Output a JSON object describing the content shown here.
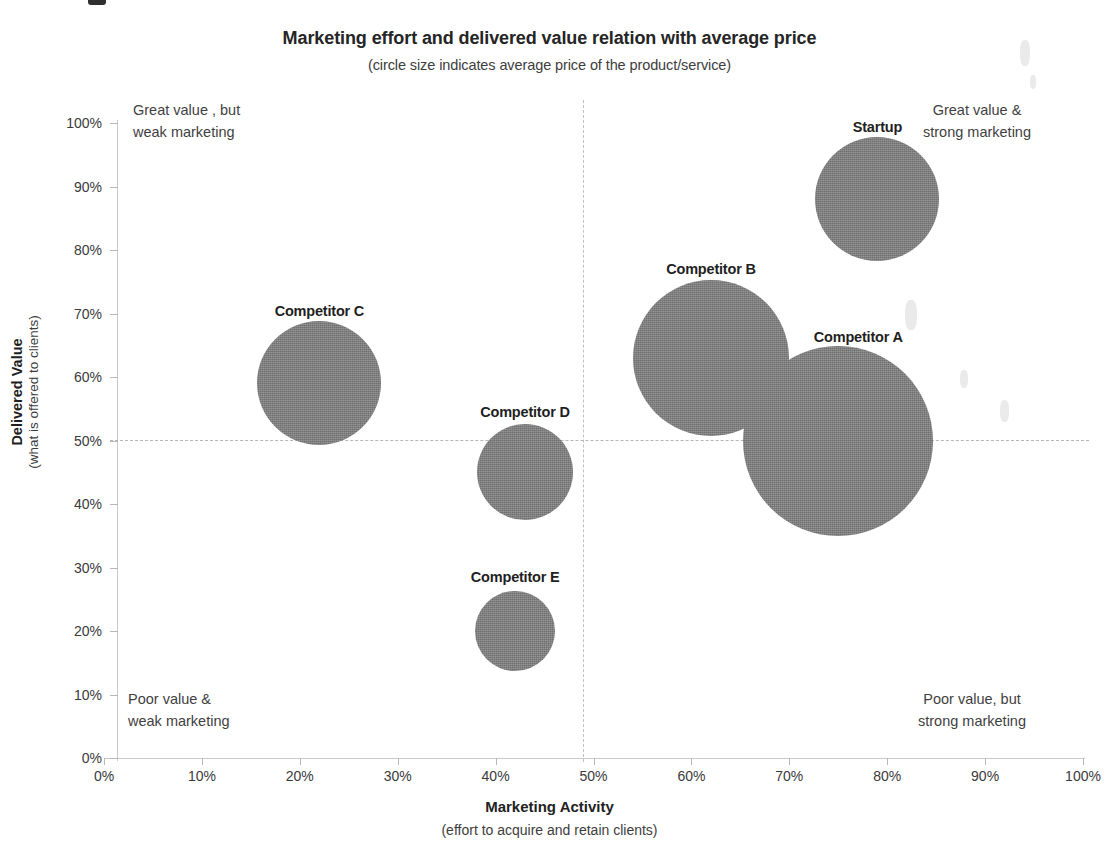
{
  "chart_data": {
    "type": "scatter",
    "title": "Marketing effort and delivered value relation with average price",
    "subtitle": "(circle size indicates average price of the product/service)",
    "xlabel": "Marketing Activity",
    "xlabel_sub": "(effort to acquire and retain clients)",
    "ylabel": "Delivered Value",
    "ylabel_sub": "(what is offered  to clients)",
    "xlim": [
      0,
      100
    ],
    "ylim": [
      0,
      100
    ],
    "x_tick_labels": [
      "0%",
      "10%",
      "20%",
      "30%",
      "40%",
      "50%",
      "60%",
      "70%",
      "80%",
      "90%",
      "100%"
    ],
    "x_tick_values": [
      0,
      10,
      20,
      30,
      40,
      50,
      60,
      70,
      80,
      90,
      100
    ],
    "y_tick_labels": [
      "0%",
      "10%",
      "20%",
      "30%",
      "40%",
      "50%",
      "60%",
      "70%",
      "80%",
      "90%",
      "100%"
    ],
    "y_tick_values": [
      0,
      10,
      20,
      30,
      40,
      50,
      60,
      70,
      80,
      90,
      100
    ],
    "grid": false,
    "legend": "none",
    "bubble_color": "#7b7b7b",
    "reference_lines": {
      "vertical_x": 50,
      "horizontal_y": 50,
      "style": "dashed",
      "color": "#bebebe"
    },
    "points": [
      {
        "label": "Startup",
        "x": 79,
        "y": 88,
        "radius_px": 62,
        "label_dx": 0,
        "label_dy": -80
      },
      {
        "label": "Competitor A",
        "x": 75,
        "y": 50,
        "radius_px": 95,
        "label_dx": 20,
        "label_dy": -112
      },
      {
        "label": "Competitor B",
        "x": 62,
        "y": 63,
        "radius_px": 78,
        "label_dx": 0,
        "label_dy": -97
      },
      {
        "label": "Competitor C",
        "x": 22,
        "y": 59,
        "radius_px": 62,
        "label_dx": 0,
        "label_dy": -80
      },
      {
        "label": "Competitor D",
        "x": 43,
        "y": 45,
        "radius_px": 48,
        "label_dx": 0,
        "label_dy": -68
      },
      {
        "label": "Competitor E",
        "x": 42,
        "y": 20,
        "radius_px": 40,
        "label_dx": 0,
        "label_dy": -62
      }
    ],
    "annotations": [
      {
        "id": "top-left",
        "text": "Great value , but\nweak marketing"
      },
      {
        "id": "top-right",
        "text": "Great value &\nstrong marketing"
      },
      {
        "id": "bottom-left",
        "text": "Poor value &\nweak  marketing"
      },
      {
        "id": "bottom-right",
        "text": "Poor  value, but\nstrong marketing"
      }
    ]
  },
  "geometry": {
    "plot_left": 104,
    "plot_top": 123,
    "plot_width": 979,
    "plot_height": 635
  }
}
